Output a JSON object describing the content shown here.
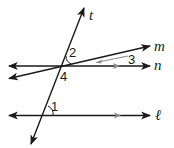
{
  "diagram": {
    "lines": [
      {
        "name": "t",
        "label": "t"
      },
      {
        "name": "m",
        "label": "m"
      },
      {
        "name": "n",
        "label": "n"
      },
      {
        "name": "l",
        "label": "ℓ"
      }
    ],
    "angles": [
      {
        "label": "1"
      },
      {
        "label": "2"
      },
      {
        "label": "3"
      },
      {
        "label": "4"
      }
    ],
    "colors": {
      "line": "#1a1a1a",
      "marker": "#8c8c8c"
    }
  }
}
